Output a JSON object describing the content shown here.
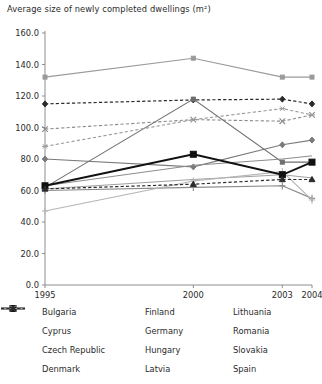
{
  "chart_data": {
    "type": "line",
    "title": "Average size of newly completed dwellings (m²)",
    "xlabel": "",
    "ylabel": "",
    "x": [
      1995,
      2000,
      2003,
      2004
    ],
    "categories": [
      "1995",
      "2000",
      "2003",
      "2004"
    ],
    "xtick_labels": [
      "1995",
      "2000",
      "2003",
      "2004"
    ],
    "ytick_labels": [
      "0.0",
      "20.0",
      "40.0",
      "60.0",
      "80.0",
      "100.0",
      "120.0",
      "140.0",
      "160.0"
    ],
    "ytick_values": [
      0,
      20,
      40,
      60,
      80,
      100,
      120,
      140,
      160
    ],
    "ylim": [
      0,
      160
    ],
    "xlim": [
      1995,
      2004
    ],
    "grid": false,
    "legend_position": "bottom",
    "legend_columns": 3,
    "series": [
      {
        "name": "Bulgaria",
        "values": [
          80.0,
          75.0,
          89.0,
          92.0
        ],
        "color": "#7a7a7a",
        "dash": "none",
        "marker": "diamond",
        "width": 1.1
      },
      {
        "name": "Cyprus",
        "values": [
          132.0,
          144.0,
          132.0,
          132.0
        ],
        "color": "#9a9a9a",
        "dash": "none",
        "marker": "square",
        "width": 1.1
      },
      {
        "name": "Czech Republic",
        "values": [
          115.0,
          117.5,
          118.0,
          115.0
        ],
        "color": "#2b2b2b",
        "dash": "dash",
        "marker": "diamond",
        "width": 1.2
      },
      {
        "name": "Denmark",
        "values": [
          99.0,
          105.0,
          104.0,
          108.0
        ],
        "color": "#8a8a8a",
        "dash": "dash",
        "marker": "x",
        "width": 1.1
      },
      {
        "name": "Finland",
        "values": [
          62.0,
          118.0,
          78.0,
          78.0
        ],
        "color": "#6e6e6e",
        "dash": "none",
        "marker": "square",
        "width": 1.1
      },
      {
        "name": "Germany",
        "values": [
          88.0,
          105.0,
          112.0,
          108.0
        ],
        "color": "#9a9a9a",
        "dash": "dash",
        "marker": "star",
        "width": 1.1
      },
      {
        "name": "Hungary",
        "values": [
          60.0,
          62.0,
          63.0,
          55.0
        ],
        "color": "#8a8a8a",
        "dash": "none",
        "marker": "plus",
        "width": 1.1
      },
      {
        "name": "Latvia",
        "values": [
          61.0,
          67.0,
          70.0,
          68.0
        ],
        "color": "#a0a0a0",
        "dash": "none",
        "marker": "none",
        "width": 1.0
      },
      {
        "name": "Lithuania",
        "values": [
          63.0,
          76.0,
          80.0,
          82.0
        ],
        "color": "#8c8c8c",
        "dash": "none",
        "marker": "none",
        "width": 1.0
      },
      {
        "name": "Romania",
        "values": [
          47.0,
          66.0,
          72.0,
          54.0
        ],
        "color": "#b4b4b4",
        "dash": "none",
        "marker": "plus",
        "width": 1.1
      },
      {
        "name": "Slovakia",
        "values": [
          63.0,
          83.0,
          70.0,
          78.0
        ],
        "color": "#111111",
        "dash": "none",
        "marker": "bigsquare",
        "width": 1.9
      },
      {
        "name": "Spain",
        "values": [
          61.0,
          64.0,
          67.0,
          67.0
        ],
        "color": "#2b2b2b",
        "dash": "dash",
        "marker": "triangle",
        "width": 1.2
      }
    ]
  },
  "legend": {
    "items": [
      {
        "label": "Bulgaria"
      },
      {
        "label": "Finland"
      },
      {
        "label": "Lithuania"
      },
      {
        "label": "Cyprus"
      },
      {
        "label": "Germany"
      },
      {
        "label": "Romania"
      },
      {
        "label": "Czech Republic"
      },
      {
        "label": "Hungary"
      },
      {
        "label": "Slovakia"
      },
      {
        "label": "Denmark"
      },
      {
        "label": "Latvia"
      },
      {
        "label": "Spain"
      }
    ],
    "order": [
      "Bulgaria",
      "Finland",
      "Lithuania",
      "Cyprus",
      "Germany",
      "Romania",
      "Czech Republic",
      "Hungary",
      "Slovakia",
      "Denmark",
      "Latvia",
      "Spain"
    ]
  },
  "colors": {
    "axis": "#8e8e8e",
    "text": "#2b2b2b",
    "background": "#ffffff"
  }
}
